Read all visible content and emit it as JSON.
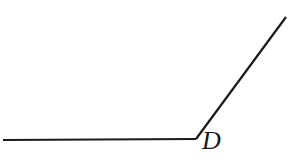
{
  "diagram": {
    "type": "angle",
    "vertex": {
      "label": "D"
    },
    "rays": [
      {
        "name": "horizontal-ray",
        "direction": "left"
      },
      {
        "name": "inclined-ray",
        "direction": "upper-right"
      }
    ],
    "colors": {
      "stroke": "#1a1a1a",
      "background": "#ffffff"
    }
  }
}
